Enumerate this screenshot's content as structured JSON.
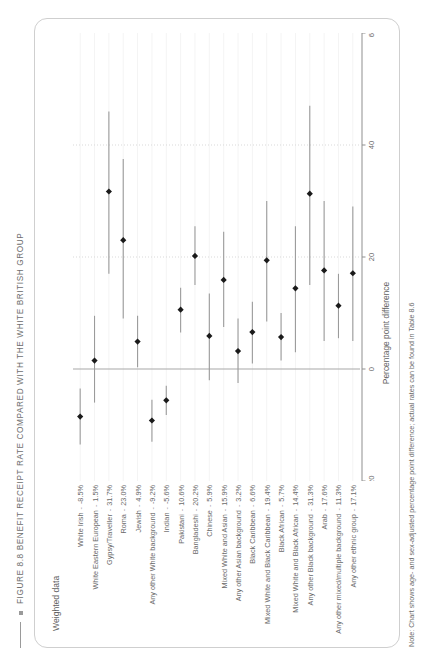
{
  "figure": {
    "bullet_icon": "square-bullet-icon",
    "title": "FIGURE 8.8 BENEFIT RECEIPT RATE COMPARED WITH THE WHITE BRITISH GROUP",
    "legend_label": "Weighted data",
    "note": "Note: Chart shows age- and sex-adjusted percentage point difference; actual rates can be found in Table 8.6"
  },
  "chart_data": {
    "type": "scatter",
    "title": "FIGURE 8.8 BENEFIT RECEIPT RATE COMPARED WITH THE WHITE BRITISH GROUP",
    "subtitle": "Weighted data",
    "orientation": "horizontal",
    "xlabel": "Percentage point difference",
    "ylabel": "",
    "xlim": [
      -20,
      60
    ],
    "xticks": [
      -20,
      0,
      20,
      40,
      60
    ],
    "xticklabels": [
      "-20",
      "0",
      "20",
      "40",
      "60"
    ],
    "grid": true,
    "gridlines_x": [
      20,
      40
    ],
    "zero_reference_line": 0,
    "legend_position": "top-left",
    "marker": "filled-diamond",
    "marker_color": "#1a1a1a",
    "errorbar_color": "#9b9b9b",
    "categories": [
      "White Irish",
      "White Eastern European",
      "Gypsy/Traveller",
      "Roma",
      "Jewish",
      "Any other White background",
      "Indian",
      "Pakistani",
      "Bangladeshi",
      "Chinese",
      "Mixed White and Asian",
      "Any other Asian background",
      "Black Caribbean",
      "Mixed White and Black Caribbean",
      "Black African",
      "Mixed White and Black African",
      "Any other Black background",
      "Arab",
      "Any other mixed/multiple background",
      "Any other ethnic group"
    ],
    "value_labels": [
      "-8.5%",
      "1.5%",
      "31.7%",
      "23.0%",
      "4.9%",
      "-9.2%",
      "-5.6%",
      "10.6%",
      "20.2%",
      "5.9%",
      "15.9%",
      "3.2%",
      "6.6%",
      "19.4%",
      "5.7%",
      "14.4%",
      "31.3%",
      "17.6%",
      "11.3%",
      "17.1%"
    ],
    "values": [
      -8.5,
      1.5,
      31.7,
      23.0,
      4.9,
      -9.2,
      -5.6,
      10.6,
      20.2,
      5.9,
      15.9,
      3.2,
      6.6,
      19.4,
      5.7,
      14.4,
      31.3,
      17.6,
      11.3,
      17.1
    ],
    "ci_low": [
      -13.5,
      -6.0,
      17.0,
      9.0,
      0.3,
      -13.0,
      -8.2,
      6.5,
      15.0,
      -2.0,
      7.5,
      -2.5,
      1.0,
      8.5,
      1.5,
      3.0,
      15.0,
      5.0,
      5.5,
      5.0
    ],
    "ci_high": [
      -3.5,
      9.5,
      46.0,
      37.5,
      9.5,
      -5.5,
      -3.0,
      14.5,
      25.5,
      13.5,
      24.5,
      9.0,
      12.0,
      30.0,
      10.0,
      25.5,
      47.0,
      30.0,
      17.0,
      29.0
    ]
  }
}
